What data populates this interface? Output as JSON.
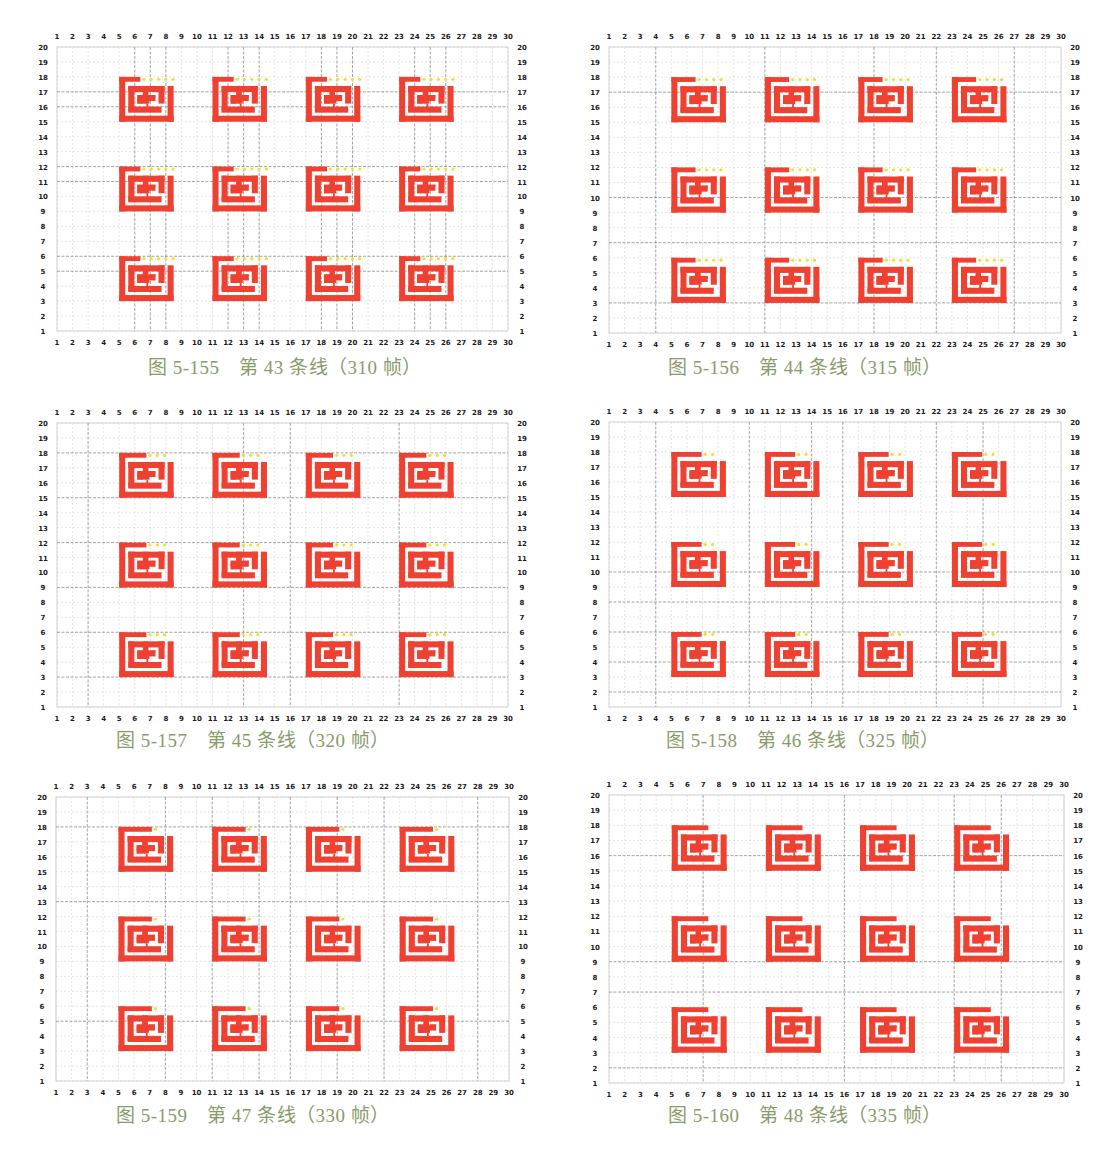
{
  "colors": {
    "spiral": "#ee4132",
    "marker": "#f0e030",
    "grid_major": "#8a8a8a",
    "grid_minor": "#d4d4d4",
    "frame": "#c8c8c8",
    "caption": "#8a9a6a",
    "tick": "#1a1a1a"
  },
  "panels": [
    {
      "id": "fig-5-155",
      "caption": "图 5-155　第 43 条线（310 帧）",
      "fig": "5-155",
      "line": 43,
      "frames": 310,
      "plot": {
        "x": 57,
        "y": 47,
        "w": 451,
        "h": 284
      },
      "caption_pos": {
        "x": 148,
        "y": 352
      },
      "major_x": [
        6,
        7,
        8,
        12,
        13,
        14,
        18,
        19,
        20,
        24,
        25,
        26
      ],
      "major_y": [
        17,
        16,
        12,
        11,
        6,
        5
      ],
      "bar_extend": 0.0,
      "dots": 5
    },
    {
      "id": "fig-5-156",
      "caption": "图 5-156　第 44 条线（315 帧）",
      "fig": "5-156",
      "line": 44,
      "frames": 315,
      "plot": {
        "x": 609,
        "y": 47,
        "w": 452,
        "h": 286
      },
      "caption_pos": {
        "x": 668,
        "y": 352
      },
      "major_x": [
        4,
        11,
        18,
        22,
        27
      ],
      "major_y": [
        17,
        10,
        7,
        3
      ],
      "bar_extend": 0.25,
      "dots": 4
    },
    {
      "id": "fig-5-157",
      "caption": "图 5-157　第 45 条线（320 帧）",
      "fig": "5-157",
      "line": 45,
      "frames": 320,
      "plot": {
        "x": 57,
        "y": 423,
        "w": 451,
        "h": 284
      },
      "caption_pos": {
        "x": 116,
        "y": 725
      },
      "major_x": [
        3,
        13,
        16,
        23
      ],
      "major_y": [
        18,
        15,
        12,
        9,
        6,
        3
      ],
      "bar_extend": 0.5,
      "dots": 3
    },
    {
      "id": "fig-5-158",
      "caption": "图 5-158　第 46 条线（325 帧）",
      "fig": "5-158",
      "line": 46,
      "frames": 325,
      "plot": {
        "x": 609,
        "y": 422,
        "w": 452,
        "h": 285
      },
      "caption_pos": {
        "x": 666,
        "y": 725
      },
      "major_x": [
        4,
        10,
        14,
        16,
        22,
        25
      ],
      "major_y": [
        10,
        8,
        6,
        4,
        2
      ],
      "bar_extend": 0.75,
      "dots": 2
    },
    {
      "id": "fig-5-159",
      "caption": "图 5-159　第 47 条线（330 帧）",
      "fig": "5-159",
      "line": 47,
      "frames": 330,
      "plot": {
        "x": 56,
        "y": 797,
        "w": 453,
        "h": 284
      },
      "caption_pos": {
        "x": 116,
        "y": 1100
      },
      "major_x": [
        3,
        8,
        11,
        14,
        16,
        19,
        22,
        28
      ],
      "major_y": [
        18,
        13,
        5
      ],
      "bar_extend": 1.0,
      "dots": 1
    },
    {
      "id": "fig-5-160",
      "caption": "图 5-160　第 48 条线（335 帧）",
      "fig": "5-160",
      "line": 48,
      "frames": 335,
      "plot": {
        "x": 609,
        "y": 795,
        "w": 455,
        "h": 288
      },
      "caption_pos": {
        "x": 668,
        "y": 1100
      },
      "major_x": [
        7,
        16,
        23,
        26
      ],
      "major_y": [
        16,
        9,
        7,
        2
      ],
      "bar_extend": 1.25,
      "dots": 0
    }
  ],
  "chart_data": {
    "type": "scatter",
    "xlabel": "",
    "ylabel": "",
    "xlim": [
      1,
      30
    ],
    "ylim": [
      1,
      20
    ],
    "x_ticks": [
      1,
      2,
      3,
      4,
      5,
      6,
      7,
      8,
      9,
      10,
      11,
      12,
      13,
      14,
      15,
      16,
      17,
      18,
      19,
      20,
      21,
      22,
      23,
      24,
      25,
      26,
      27,
      28,
      29,
      30
    ],
    "y_ticks": [
      1,
      2,
      3,
      4,
      5,
      6,
      7,
      8,
      9,
      10,
      11,
      12,
      13,
      14,
      15,
      16,
      17,
      18,
      19,
      20
    ],
    "grid": true,
    "layout": {
      "spiral_columns_x": [
        [
          5,
          8.5
        ],
        [
          11,
          14.5
        ],
        [
          17,
          20.5
        ],
        [
          23,
          26.5
        ]
      ],
      "spiral_rows_y": [
        [
          15,
          18
        ],
        [
          9,
          12
        ],
        [
          3,
          6
        ]
      ]
    },
    "panels": [
      {
        "figure": "图 5-155",
        "line": 43,
        "frames": 310,
        "remaining_yellow_markers": 5
      },
      {
        "figure": "图 5-156",
        "line": 44,
        "frames": 315,
        "remaining_yellow_markers": 4
      },
      {
        "figure": "图 5-157",
        "line": 45,
        "frames": 320,
        "remaining_yellow_markers": 3
      },
      {
        "figure": "图 5-158",
        "line": 46,
        "frames": 325,
        "remaining_yellow_markers": 2
      },
      {
        "figure": "图 5-159",
        "line": 47,
        "frames": 330,
        "remaining_yellow_markers": 1
      },
      {
        "figure": "图 5-160",
        "line": 48,
        "frames": 335,
        "remaining_yellow_markers": 0
      }
    ]
  }
}
